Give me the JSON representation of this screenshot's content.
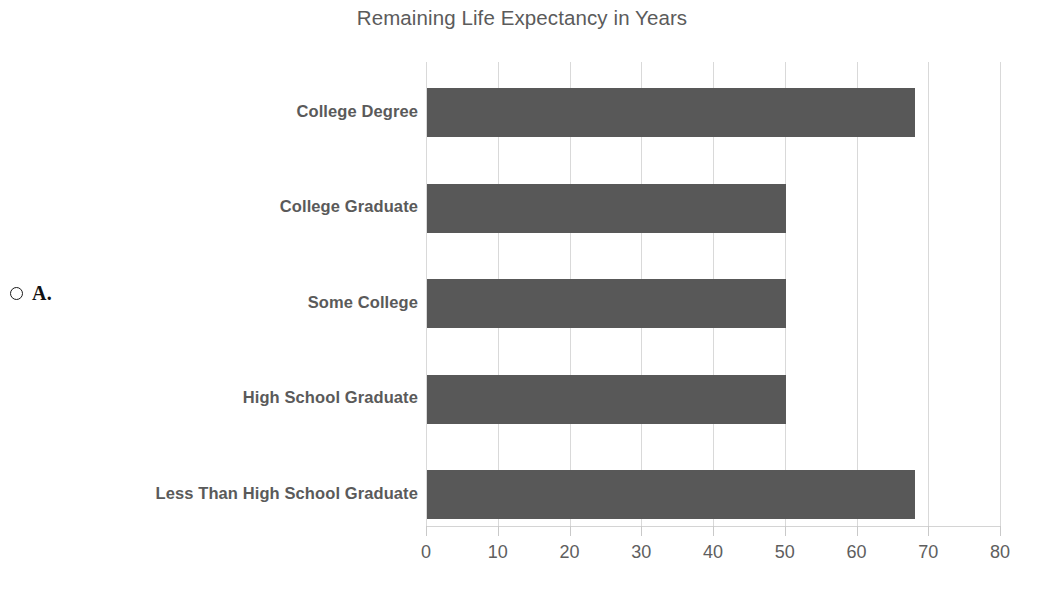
{
  "question": {
    "option_marker": "radio-unselected",
    "option_letter": "A."
  },
  "chart_data": {
    "type": "bar",
    "orientation": "horizontal",
    "title": "Remaining Life Expectancy in Years",
    "xlabel": "",
    "ylabel": "",
    "categories": [
      "College Degree",
      "College Graduate",
      "Some College",
      "High School Graduate",
      "Less Than High School Graduate"
    ],
    "values": [
      68,
      50,
      50,
      50,
      68
    ],
    "xlim": [
      0,
      80
    ],
    "xticks": [
      0,
      10,
      20,
      30,
      40,
      50,
      60,
      70,
      80
    ],
    "xtick_labels": [
      "0",
      "10",
      "20",
      "30",
      "40",
      "50",
      "60",
      "70",
      "80"
    ],
    "grid": "vertical",
    "legend": "none",
    "bar_color": "#585858",
    "grid_color": "#d9d9d9",
    "text_color": "#5a5a5a"
  }
}
